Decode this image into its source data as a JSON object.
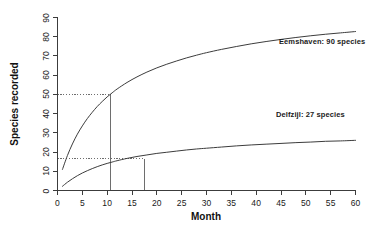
{
  "chart_data": {
    "type": "line",
    "title": "",
    "subtitle": "",
    "xlabel": "Month",
    "ylabel": "Species recorded",
    "xlim": [
      0,
      60
    ],
    "ylim": [
      0,
      90
    ],
    "xticks": [
      0,
      5,
      10,
      15,
      20,
      25,
      30,
      35,
      40,
      45,
      50,
      55,
      60
    ],
    "yticks": [
      0,
      10,
      20,
      30,
      40,
      50,
      60,
      70,
      80,
      90
    ],
    "xtick_labels": [
      "0",
      "5",
      "10",
      "15",
      "20",
      "25",
      "30",
      "35",
      "40",
      "45",
      "50",
      "55",
      "60"
    ],
    "ytick_labels": [
      "0",
      "10",
      "20",
      "30",
      "40",
      "50",
      "60",
      "70",
      "80",
      "90"
    ],
    "grid": false,
    "legend_position": "inline-annotations",
    "line_color": "#3c3c3c",
    "guide_color": "#6e6e6e",
    "axis_color": "#3c3c3c",
    "background": "#ffffff",
    "series": [
      {
        "name": "Eemshaven",
        "annotation": "Eemshaven: 90 species",
        "asymptote": 90,
        "x": [
          1,
          2,
          3,
          4,
          5,
          6,
          7,
          8,
          9,
          10,
          11,
          12,
          14,
          16,
          18,
          20,
          22,
          24,
          26,
          28,
          30,
          33,
          36,
          39,
          42,
          45,
          48,
          51,
          54,
          57,
          60
        ],
        "values": [
          11.0,
          18.2,
          24.2,
          29.3,
          33.6,
          37.4,
          40.7,
          43.7,
          46.3,
          48.7,
          50.8,
          52.8,
          56.2,
          59.1,
          61.6,
          63.8,
          65.7,
          67.4,
          69.0,
          70.4,
          71.7,
          73.4,
          74.9,
          76.3,
          77.5,
          78.6,
          79.6,
          80.5,
          81.3,
          82.0,
          82.7
        ]
      },
      {
        "name": "Delfzijl",
        "annotation": "Delfzijl: 27 species",
        "asymptote": 27,
        "x": [
          1,
          2,
          3,
          4,
          5,
          6,
          7,
          8,
          9,
          10,
          11,
          12,
          14,
          16,
          18,
          20,
          22,
          24,
          26,
          28,
          30,
          33,
          36,
          39,
          42,
          45,
          48,
          51,
          54,
          57,
          60
        ],
        "values": [
          2.2,
          4.3,
          6.1,
          7.7,
          9.1,
          10.3,
          11.4,
          12.4,
          13.3,
          14.1,
          14.8,
          15.5,
          16.7,
          17.7,
          18.5,
          19.3,
          19.9,
          20.5,
          21.1,
          21.6,
          22.0,
          22.6,
          23.2,
          23.7,
          24.1,
          24.5,
          24.9,
          25.2,
          25.6,
          25.8,
          26.1
        ]
      }
    ],
    "reference_lines": [
      {
        "name": "eemshaven-half-reference",
        "y": 50,
        "x": 10.7,
        "style": "dotted-horizontal-solid-vertical"
      },
      {
        "name": "delfzijl-half-reference",
        "y": 16.5,
        "x": 17.5,
        "style": "dotted-horizontal-solid-vertical"
      }
    ]
  },
  "axis": {
    "x_title": "Month",
    "y_title": "Species recorded"
  },
  "annotations": {
    "eemshaven": "Eemshaven: 90 species",
    "delfzijl": "Delfzijl: 27 species"
  }
}
